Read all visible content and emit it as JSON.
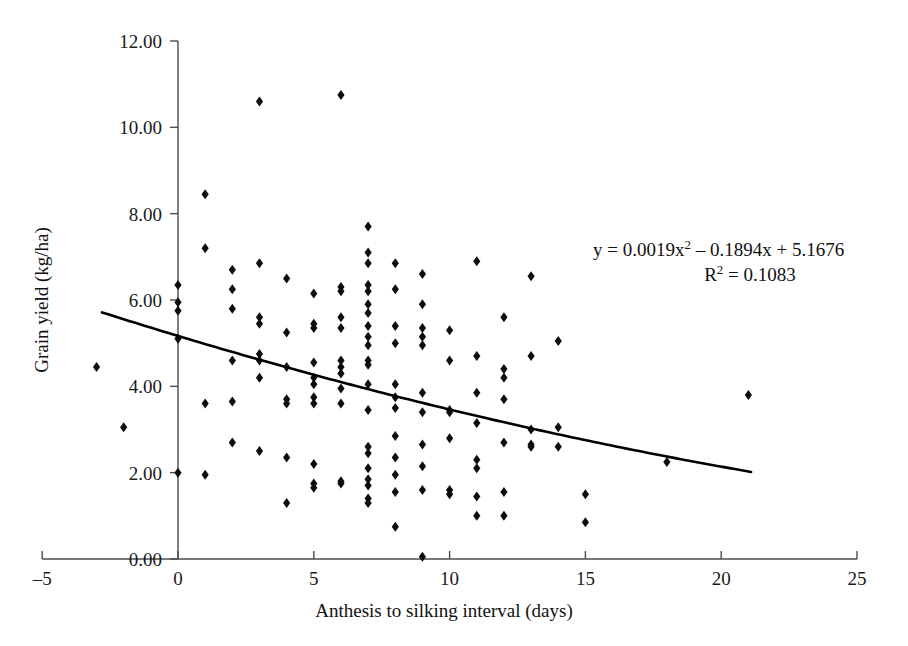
{
  "chart_data": {
    "type": "scatter",
    "title": "",
    "xlabel": "Anthesis to silking interval (days)",
    "ylabel": "Grain yield (kg/ha)",
    "xlim": [
      -5,
      25
    ],
    "ylim": [
      0,
      12
    ],
    "xticks": [
      -5,
      0,
      5,
      10,
      15,
      20,
      25
    ],
    "xtick_labels": [
      "–5",
      "0",
      "5",
      "10",
      "15",
      "20",
      "25"
    ],
    "yticks": [
      0,
      2,
      4,
      6,
      8,
      10,
      12
    ],
    "ytick_labels": [
      "0.00",
      "2.00",
      "4.00",
      "6.00",
      "8.00",
      "10.00",
      "12.00"
    ],
    "grid": false,
    "legend": false,
    "marker": "diamond",
    "marker_color": "#0d0d0d",
    "series": [
      {
        "name": "Observations",
        "points": [
          [
            -3,
            4.45
          ],
          [
            -2,
            3.05
          ],
          [
            0,
            6.35
          ],
          [
            0,
            5.95
          ],
          [
            0,
            5.75
          ],
          [
            0,
            5.1
          ],
          [
            0,
            2.0
          ],
          [
            1,
            8.45
          ],
          [
            1,
            7.2
          ],
          [
            1,
            3.6
          ],
          [
            1,
            1.95
          ],
          [
            2,
            6.7
          ],
          [
            2,
            6.25
          ],
          [
            2,
            5.8
          ],
          [
            2,
            4.6
          ],
          [
            2,
            3.65
          ],
          [
            2,
            2.7
          ],
          [
            3,
            10.6
          ],
          [
            3,
            6.85
          ],
          [
            3,
            5.6
          ],
          [
            3,
            5.45
          ],
          [
            3,
            4.75
          ],
          [
            3,
            4.6
          ],
          [
            3,
            4.2
          ],
          [
            3,
            2.5
          ],
          [
            4,
            6.5
          ],
          [
            4,
            5.25
          ],
          [
            4,
            4.45
          ],
          [
            4,
            3.7
          ],
          [
            4,
            3.6
          ],
          [
            4,
            2.35
          ],
          [
            4,
            1.3
          ],
          [
            5,
            6.15
          ],
          [
            5,
            5.45
          ],
          [
            5,
            5.35
          ],
          [
            5,
            4.55
          ],
          [
            5,
            4.2
          ],
          [
            5,
            4.05
          ],
          [
            5,
            3.75
          ],
          [
            5,
            3.6
          ],
          [
            5,
            2.2
          ],
          [
            5,
            1.75
          ],
          [
            5,
            1.65
          ],
          [
            6,
            10.75
          ],
          [
            6,
            6.3
          ],
          [
            6,
            6.2
          ],
          [
            6,
            5.6
          ],
          [
            6,
            5.35
          ],
          [
            6,
            4.6
          ],
          [
            6,
            4.45
          ],
          [
            6,
            4.3
          ],
          [
            6,
            3.95
          ],
          [
            6,
            3.6
          ],
          [
            6,
            1.8
          ],
          [
            6,
            1.75
          ],
          [
            7,
            7.7
          ],
          [
            7,
            7.1
          ],
          [
            7,
            6.85
          ],
          [
            7,
            6.35
          ],
          [
            7,
            6.2
          ],
          [
            7,
            5.9
          ],
          [
            7,
            5.7
          ],
          [
            7,
            5.4
          ],
          [
            7,
            5.15
          ],
          [
            7,
            4.95
          ],
          [
            7,
            4.6
          ],
          [
            7,
            4.5
          ],
          [
            7,
            4.05
          ],
          [
            7,
            3.45
          ],
          [
            7,
            2.6
          ],
          [
            7,
            2.45
          ],
          [
            7,
            2.1
          ],
          [
            7,
            1.85
          ],
          [
            7,
            1.7
          ],
          [
            7,
            1.4
          ],
          [
            7,
            1.3
          ],
          [
            8,
            6.85
          ],
          [
            8,
            6.25
          ],
          [
            8,
            5.4
          ],
          [
            8,
            5.0
          ],
          [
            8,
            4.05
          ],
          [
            8,
            3.75
          ],
          [
            8,
            3.5
          ],
          [
            8,
            2.85
          ],
          [
            8,
            2.35
          ],
          [
            8,
            1.95
          ],
          [
            8,
            1.55
          ],
          [
            8,
            0.75
          ],
          [
            9,
            6.6
          ],
          [
            9,
            5.9
          ],
          [
            9,
            5.35
          ],
          [
            9,
            5.15
          ],
          [
            9,
            4.95
          ],
          [
            9,
            3.85
          ],
          [
            9,
            3.4
          ],
          [
            9,
            2.65
          ],
          [
            9,
            2.15
          ],
          [
            9,
            1.6
          ],
          [
            9,
            0.05
          ],
          [
            10,
            5.3
          ],
          [
            10,
            4.6
          ],
          [
            10,
            3.45
          ],
          [
            10,
            3.4
          ],
          [
            10,
            2.8
          ],
          [
            10,
            1.6
          ],
          [
            10,
            1.5
          ],
          [
            11,
            6.9
          ],
          [
            11,
            4.7
          ],
          [
            11,
            3.85
          ],
          [
            11,
            3.15
          ],
          [
            11,
            2.3
          ],
          [
            11,
            2.1
          ],
          [
            11,
            1.45
          ],
          [
            11,
            1.0
          ],
          [
            12,
            5.6
          ],
          [
            12,
            4.4
          ],
          [
            12,
            4.2
          ],
          [
            12,
            3.7
          ],
          [
            12,
            2.7
          ],
          [
            12,
            1.55
          ],
          [
            12,
            1.0
          ],
          [
            13,
            6.55
          ],
          [
            13,
            4.7
          ],
          [
            13,
            3.0
          ],
          [
            13,
            2.65
          ],
          [
            13,
            2.6
          ],
          [
            14,
            5.05
          ],
          [
            14,
            3.05
          ],
          [
            14,
            2.6
          ],
          [
            15,
            1.5
          ],
          [
            15,
            0.85
          ],
          [
            18,
            2.25
          ],
          [
            21,
            3.8
          ]
        ]
      }
    ],
    "trendline": {
      "type": "polynomial",
      "degree": 2,
      "equation": "y = 0.0019x² – 0.1894x + 5.1676",
      "equation_prefix": "y = 0.0019x",
      "equation_suffix": " – 0.1894x + 5.1676",
      "equation_exponent": "2",
      "r2_label": "R",
      "r2_exponent": "2",
      "r2_value": " = 0.1083",
      "r_squared": 0.1083,
      "coefficients": [
        0.0019,
        -0.1894,
        5.1676
      ],
      "x_start": -2.8,
      "x_end": 21.1,
      "color": "#000000"
    }
  }
}
